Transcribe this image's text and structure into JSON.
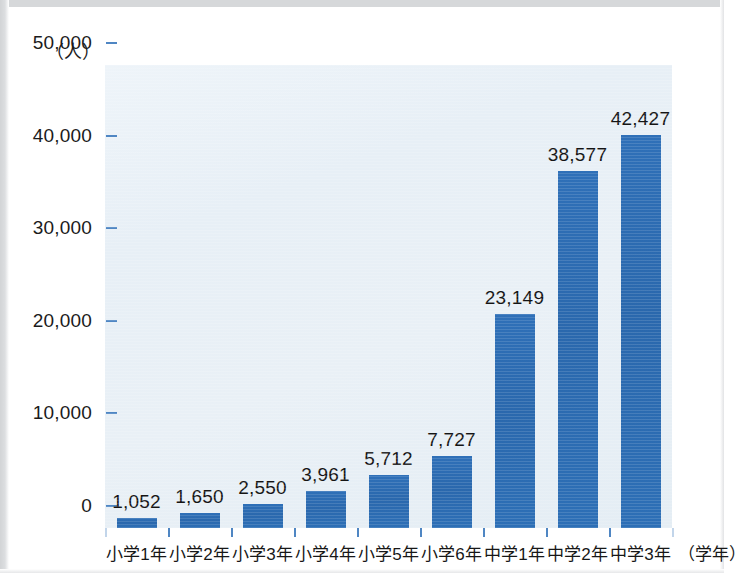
{
  "chart_data": {
    "type": "bar",
    "title": "",
    "subtitle": "",
    "xlabel": "（学年）",
    "ylabel": "（人）",
    "categories": [
      "小学1年",
      "小学2年",
      "小学3年",
      "小学4年",
      "小学5年",
      "小学6年",
      "中学1年",
      "中学2年",
      "中学3年"
    ],
    "values": [
      1052,
      1650,
      2550,
      3961,
      5712,
      7727,
      23149,
      38577,
      42427
    ],
    "value_labels": [
      "1,052",
      "1,650",
      "2,550",
      "3,961",
      "5,712",
      "7,727",
      "23,149",
      "38,577",
      "42,427"
    ],
    "ylim": [
      0,
      50000
    ],
    "ytick_values": [
      0,
      10000,
      20000,
      30000,
      40000,
      50000
    ],
    "ytick_labels": [
      "0",
      "10,000",
      "20,000",
      "30,000",
      "40,000",
      "50,000"
    ],
    "grid": false,
    "legend": null,
    "series": [
      {
        "name": "人数",
        "values": [
          1052,
          1650,
          2550,
          3961,
          5712,
          7727,
          23149,
          38577,
          42427
        ]
      }
    ]
  },
  "style": {
    "bar_color": "#2d6cb2",
    "plot_background": "#e8eff6",
    "page_background": "#ffffff",
    "tick_color": "#4f86c3",
    "text_color": "#171717",
    "frame_color": "#d6d8da"
  }
}
